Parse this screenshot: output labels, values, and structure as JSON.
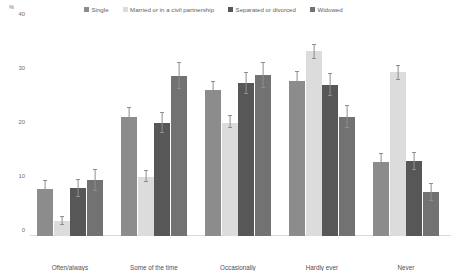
{
  "chart_data": {
    "type": "bar",
    "title": "",
    "subtitle": "",
    "xlabel": "",
    "ylabel": "%",
    "ylim": [
      0,
      40
    ],
    "yticks": [
      0,
      10,
      20,
      30,
      40
    ],
    "grid": false,
    "legend_position": "top",
    "orientation": "vertical",
    "grouping": "clustered",
    "categories": [
      "Often/always",
      "Some of the time",
      "Occasionally",
      "Hardly ever",
      "Never"
    ],
    "series": [
      {
        "name": "Single",
        "color": "#8c8c8c",
        "values": [
          8.7,
          22.0,
          27.0,
          28.7,
          13.7
        ],
        "error_low": [
          7.3,
          20.3,
          25.3,
          27.0,
          12.3
        ],
        "error_high": [
          10.2,
          23.8,
          28.6,
          30.4,
          15.2
        ]
      },
      {
        "name": "Married or in a civil partnership",
        "color": "#dcdcdc",
        "values": [
          2.8,
          11.0,
          21.0,
          34.2,
          30.3
        ],
        "error_low": [
          2.0,
          10.0,
          20.0,
          32.9,
          29.0
        ],
        "error_high": [
          3.6,
          12.1,
          22.2,
          35.5,
          31.6
        ]
      },
      {
        "name": "Separated or divorced",
        "color": "#575757",
        "values": [
          8.8,
          21.0,
          28.3,
          28.0,
          13.8
        ],
        "error_low": [
          7.2,
          19.1,
          26.4,
          26.0,
          12.2
        ],
        "error_high": [
          10.4,
          22.9,
          30.3,
          30.0,
          15.4
        ]
      },
      {
        "name": "Widowed",
        "color": "#727272",
        "values": [
          10.3,
          29.7,
          29.8,
          22.0,
          8.1
        ],
        "error_low": [
          8.4,
          27.3,
          27.5,
          20.0,
          6.6
        ],
        "error_high": [
          12.3,
          32.1,
          32.1,
          24.1,
          9.7
        ]
      }
    ]
  }
}
